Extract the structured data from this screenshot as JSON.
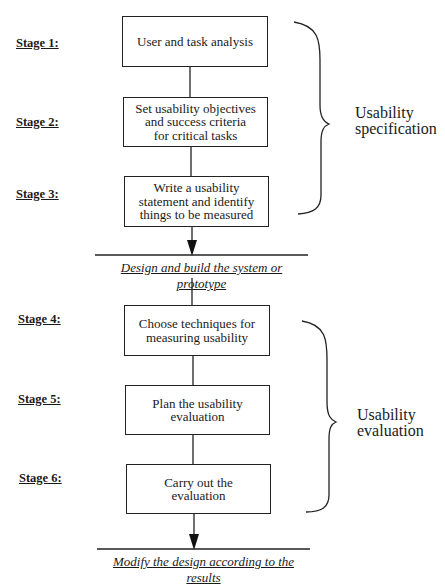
{
  "stages": [
    {
      "label": "Stage 1:",
      "text": "User and task analysis"
    },
    {
      "label": "Stage 2:",
      "text": "Set usability objectives\nand success criteria\nfor critical tasks"
    },
    {
      "label": "Stage 3:",
      "text": "Write a usability\nstatement and identify\nthings to be measured"
    },
    {
      "label": "Stage 4:",
      "text": "Choose techniques for\nmeasuring usability"
    },
    {
      "label": "Stage 5:",
      "text": "Plan the usability\nevaluation"
    },
    {
      "label": "Stage 6:",
      "text": "Carry out  the\nevaluation"
    }
  ],
  "phases": [
    {
      "text": "Design and build the system or prototype"
    },
    {
      "text": "Modify the design according to the results"
    }
  ],
  "groups": [
    {
      "text": "Usability\nspecification"
    },
    {
      "text": "Usability\nevaluation"
    }
  ]
}
